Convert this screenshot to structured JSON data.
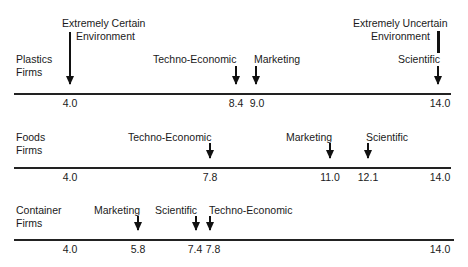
{
  "title": "",
  "scale": {
    "min": 4.0,
    "max": 14.0,
    "x_at_min": 70,
    "x_at_max": 438
  },
  "environment_labels": {
    "certain": {
      "line1": "Extremely Certain",
      "line2": "Environment"
    },
    "uncertain": {
      "line1": "Extremely Uncertain",
      "line2": "Environment"
    }
  },
  "rows": [
    {
      "label": "Plastics\nFirms",
      "baseline_y": 93,
      "ticks": [
        "4.0",
        "8.4",
        "9.0",
        "14.0"
      ],
      "markers": [
        {
          "name": "Techno-Economic",
          "value": 8.4,
          "value_label": "8.4"
        },
        {
          "name": "Marketing",
          "value": 9.0,
          "value_label": "9.0"
        },
        {
          "name": "Scientific",
          "value": 14.0,
          "value_label": "14.0"
        }
      ]
    },
    {
      "label": "Foods\nFirms",
      "baseline_y": 167,
      "ticks": [
        "4.0",
        "7.8",
        "11.0",
        "12.1",
        "14.0"
      ],
      "markers": [
        {
          "name": "Techno-Economic",
          "value": 7.8,
          "value_label": "7.8"
        },
        {
          "name": "Marketing",
          "value": 11.0,
          "value_label": "11.0"
        },
        {
          "name": "Scientific",
          "value": 12.1,
          "value_label": "12.1"
        }
      ]
    },
    {
      "label": "Container\nFirms",
      "baseline_y": 239,
      "ticks": [
        "4.0",
        "5.8",
        "7.4",
        "7.8",
        "14.0"
      ],
      "markers": [
        {
          "name": "Marketing",
          "value": 5.8,
          "value_label": "5.8"
        },
        {
          "name": "Scientific",
          "value": 7.4,
          "value_label": "7.4"
        },
        {
          "name": "Techno-Economic",
          "value": 7.8,
          "value_label": "7.8"
        }
      ]
    }
  ]
}
